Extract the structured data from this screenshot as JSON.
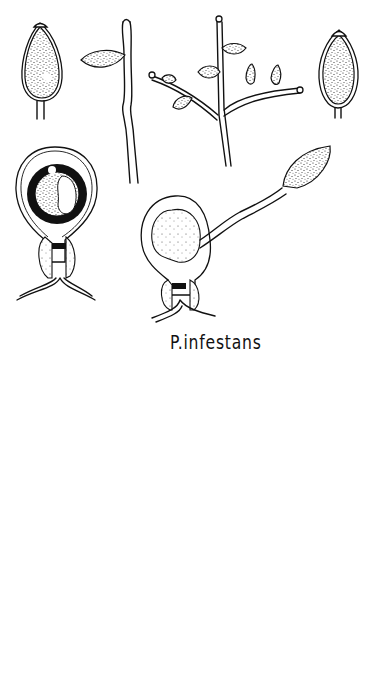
{
  "figure": {
    "label": "P. infestans",
    "label_display": "P.infestans",
    "groups": [
      {
        "name": "sporangia-and-sporangiophores",
        "items": [
          "sporangium-top-left",
          "sporangiophore-simple",
          "sporangiophore-branched",
          "sporangium-top-right"
        ]
      },
      {
        "name": "oospores-with-germ-tube",
        "items": [
          "oospore-with-antheridium-left",
          "germinating-oospore-with-germ-sporangium"
        ]
      },
      {
        "name": "sporangia-row",
        "items": [
          "sporangium-1",
          "sporangium-2",
          "sporangium-3",
          "sporangium-4"
        ]
      },
      {
        "name": "oospores-bottom",
        "items": [
          "oospore-bottom-left",
          "oospore-bottom-center"
        ]
      }
    ],
    "colors": {
      "ink": "#111111",
      "paper": "#ffffff"
    }
  }
}
